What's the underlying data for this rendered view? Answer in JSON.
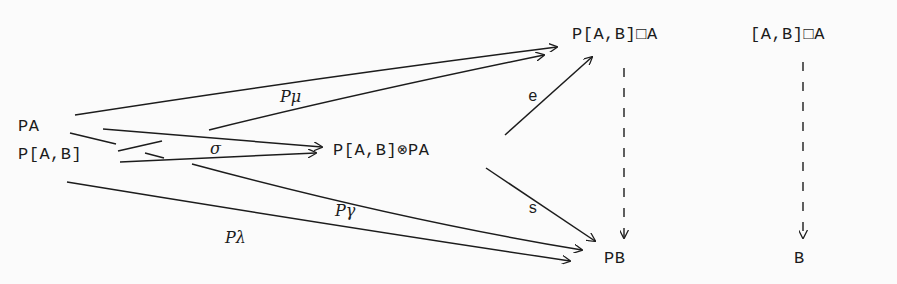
{
  "diagram": {
    "type": "commutative-diagram",
    "nodes": {
      "pa": "PA",
      "pab": "P[A,B]",
      "tensor": "P[A,B]⊗PA",
      "box_top": "P[A,B]□A",
      "box_right": "[A,B]□A",
      "pb": "PB",
      "b": "B"
    },
    "edge_labels": {
      "p_mu": "Pμ",
      "sigma": "σ",
      "e": "e",
      "s": "s",
      "p_gamma": "Pγ",
      "p_lambda": "Pλ"
    },
    "edges": [
      {
        "from": "PA",
        "to": "P[A,B]□A",
        "label": "Pμ",
        "style": "solid"
      },
      {
        "from": "P[A,B]",
        "to": "P[A,B]□A",
        "label": "Pμ",
        "style": "solid"
      },
      {
        "from": "PA",
        "to": "P[A,B]⊗PA",
        "label": "σ",
        "style": "solid"
      },
      {
        "from": "P[A,B]",
        "to": "P[A,B]⊗PA",
        "label": "σ",
        "style": "solid"
      },
      {
        "from": "P[A,B]⊗PA",
        "to": "P[A,B]□A",
        "label": "e",
        "style": "solid"
      },
      {
        "from": "P[A,B]⊗PA",
        "to": "PB",
        "label": "s",
        "style": "solid"
      },
      {
        "from": "P[A,B]",
        "to": "PB",
        "label": "Pγ",
        "style": "solid"
      },
      {
        "from": "P[A,B]",
        "to": "PB",
        "label": "Pλ",
        "style": "solid"
      },
      {
        "from": "P[A,B]□A",
        "to": "PB",
        "label": "",
        "style": "dashed"
      },
      {
        "from": "[A,B]□A",
        "to": "B",
        "label": "",
        "style": "dashed"
      }
    ],
    "colors": {
      "ink": "#1c1c1c",
      "paper": "#fbfbfb"
    }
  }
}
